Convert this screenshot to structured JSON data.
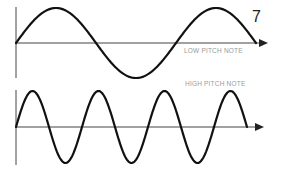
{
  "page_number": "7",
  "colors": {
    "wave": "#111111",
    "axis": "#444444",
    "label": "#9a9a9a",
    "background": "#ffffff"
  },
  "diagrams": [
    {
      "name": "low-pitch",
      "label": "LOW PITCH NOTE",
      "cycles": 1.5,
      "x_start": 16,
      "x_end": 256,
      "axis_y": 43,
      "amplitude": 35,
      "axis_top": 7,
      "axis_bottom": 78,
      "arrow_tip": 268
    },
    {
      "name": "high-pitch",
      "label": "HIGH PITCH NOTE",
      "cycles": 3.5,
      "x_start": 16,
      "x_end": 247,
      "axis_y": 127,
      "amplitude": 36,
      "axis_top": 90,
      "axis_bottom": 165,
      "arrow_tip": 264
    }
  ]
}
